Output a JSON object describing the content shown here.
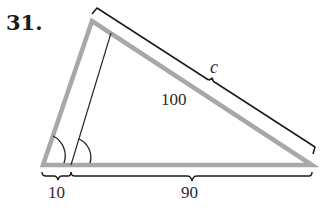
{
  "problem": {
    "number": "31."
  },
  "labels": {
    "hypotenuse": "c",
    "side": "100",
    "left_segment": "10",
    "right_segment": "90"
  },
  "colors": {
    "triangle_stroke": "#a8a8a8",
    "line_stroke": "#1a1a1a",
    "background": "#ffffff"
  }
}
